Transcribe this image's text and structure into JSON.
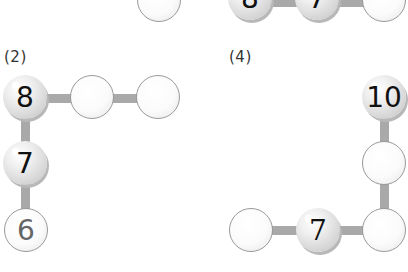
{
  "top_partial": {
    "left_group": [
      {
        "value": ""
      }
    ],
    "right_group": [
      {
        "value": "8"
      },
      {
        "value": "7"
      },
      {
        "value": ""
      }
    ]
  },
  "puzzles": [
    {
      "label": "(2)",
      "balls": [
        {
          "value": "8",
          "filled": true
        },
        {
          "value": "",
          "filled": false
        },
        {
          "value": "",
          "filled": false
        },
        {
          "value": "7",
          "filled": true
        },
        {
          "value": "6",
          "filled": false
        }
      ]
    },
    {
      "label": "(4)",
      "balls": [
        {
          "value": "10",
          "filled": true
        },
        {
          "value": "",
          "filled": false
        },
        {
          "value": "",
          "filled": false
        },
        {
          "value": "7",
          "filled": true
        },
        {
          "value": "",
          "filled": false
        }
      ]
    }
  ]
}
